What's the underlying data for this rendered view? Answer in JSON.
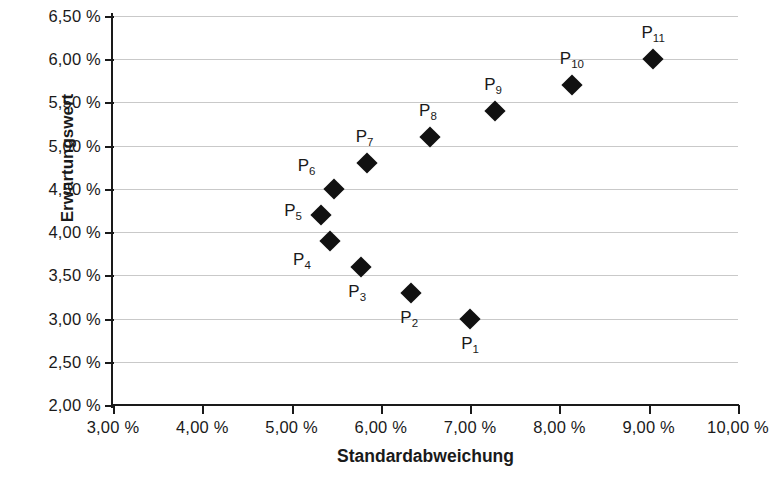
{
  "chart_data": {
    "type": "scatter",
    "title": "",
    "xlabel": "Standardabweichung",
    "ylabel": "Erwartungswert",
    "xlim": [
      3.0,
      10.0
    ],
    "ylim": [
      2.0,
      6.5
    ],
    "grid": true,
    "legend": "none",
    "xtick_labels": [
      "3,00 %",
      "4,00 %",
      "5,00 %",
      "6,00 %",
      "7,00 %",
      "8,00 %",
      "9,00 %",
      "10,00 %"
    ],
    "xtick_values": [
      3.0,
      4.0,
      5.0,
      6.0,
      7.0,
      8.0,
      9.0,
      10.0
    ],
    "ytick_labels": [
      "6,50 %",
      "6,00 %",
      "5,50 %",
      "5,00 %",
      "4,50 %",
      "4,00 %",
      "3,50 %",
      "3,00 %",
      "2,50 %",
      "2,00 %"
    ],
    "ytick_values": [
      6.5,
      6.0,
      5.5,
      5.0,
      4.5,
      4.0,
      3.5,
      3.0,
      2.5,
      2.0
    ],
    "marker_color": "#111111",
    "marker_shape": "diamond",
    "points": [
      {
        "name": "P",
        "sub": "1",
        "label": "P1",
        "x": 7.0,
        "y": 3.0,
        "label_dx": 0,
        "label_dy": 26
      },
      {
        "name": "P",
        "sub": "2",
        "label": "P2",
        "x": 6.34,
        "y": 3.3,
        "label_dx": -2,
        "label_dy": 26
      },
      {
        "name": "P",
        "sub": "3",
        "label": "P3",
        "x": 5.78,
        "y": 3.6,
        "label_dx": -4,
        "label_dy": 26
      },
      {
        "name": "P",
        "sub": "4",
        "label": "P4",
        "x": 5.43,
        "y": 3.9,
        "label_dx": -28,
        "label_dy": 20
      },
      {
        "name": "P",
        "sub": "5",
        "label": "P5",
        "x": 5.33,
        "y": 4.2,
        "label_dx": -28,
        "label_dy": -3
      },
      {
        "name": "P",
        "sub": "6",
        "label": "P6",
        "x": 5.47,
        "y": 4.5,
        "label_dx": -27,
        "label_dy": -22
      },
      {
        "name": "P",
        "sub": "7",
        "label": "P7",
        "x": 5.84,
        "y": 4.8,
        "label_dx": -2,
        "label_dy": -25
      },
      {
        "name": "P",
        "sub": "8",
        "label": "P8",
        "x": 6.55,
        "y": 5.1,
        "label_dx": -2,
        "label_dy": -25
      },
      {
        "name": "P",
        "sub": "9",
        "label": "P9",
        "x": 7.28,
        "y": 5.4,
        "label_dx": -2,
        "label_dy": -25
      },
      {
        "name": "P",
        "sub": "10",
        "label": "P10",
        "x": 8.14,
        "y": 5.7,
        "label_dx": 0,
        "label_dy": -25
      },
      {
        "name": "P",
        "sub": "11",
        "label": "P11",
        "x": 9.05,
        "y": 6.0,
        "label_dx": 0,
        "label_dy": -25
      }
    ]
  }
}
